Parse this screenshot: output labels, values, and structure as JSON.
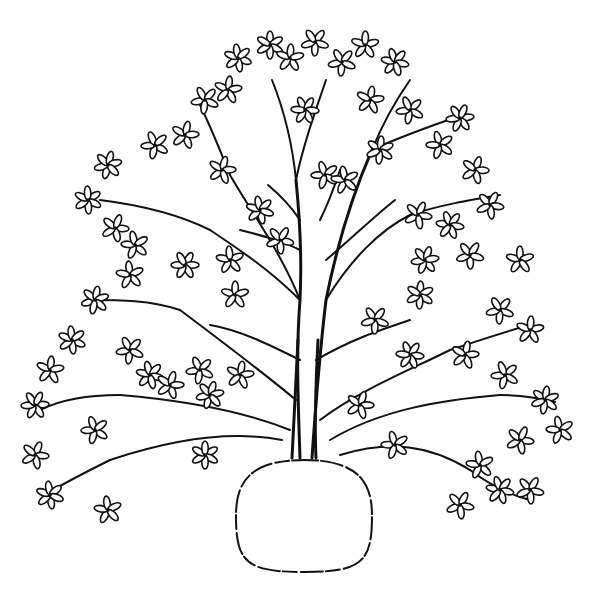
{
  "illustration": {
    "subject": "tree with root ball",
    "style": "black line art on white",
    "colors": {
      "ink": "#111111",
      "background": "#ffffff"
    },
    "root_ball": {
      "cx": 304,
      "cy": 516,
      "rx": 68,
      "ry": 56
    },
    "trunk_base": {
      "x": 304,
      "y": 455
    },
    "branches": [
      {
        "d": "M300 458 C298 400 296 350 300 300 C302 260 300 220 296 180"
      },
      {
        "d": "M312 458 C316 400 320 350 326 300 C336 250 350 200 372 150"
      },
      {
        "d": "M296 180 C292 140 284 110 272 80"
      },
      {
        "d": "M296 180 C304 140 316 110 326 80"
      },
      {
        "d": "M372 150 C384 120 396 100 410 80"
      },
      {
        "d": "M372 150 C392 140 420 130 448 120"
      },
      {
        "d": "M300 300 C270 270 240 250 210 230"
      },
      {
        "d": "M210 230 C180 215 140 205 100 200"
      },
      {
        "d": "M300 300 C280 250 250 210 230 175"
      },
      {
        "d": "M230 175 C220 150 210 125 200 105"
      },
      {
        "d": "M326 300 C350 260 380 230 410 215"
      },
      {
        "d": "M410 215 C440 205 470 200 500 195"
      },
      {
        "d": "M296 400 C260 370 220 340 180 310"
      },
      {
        "d": "M180 310 C150 300 120 300 90 300"
      },
      {
        "d": "M290 430 C240 410 180 400 120 395"
      },
      {
        "d": "M120 395 C90 395 60 400 40 410"
      },
      {
        "d": "M282 440 C230 430 170 440 110 460"
      },
      {
        "d": "M110 460 C80 475 60 485 45 495"
      },
      {
        "d": "M320 420 C360 390 410 370 450 350"
      },
      {
        "d": "M450 350 C480 340 510 330 530 325"
      },
      {
        "d": "M330 440 C380 410 440 400 500 395"
      },
      {
        "d": "M500 395 C520 395 540 398 555 402"
      },
      {
        "d": "M340 455 C390 440 430 445 470 470"
      },
      {
        "d": "M470 470 C490 485 510 495 530 500"
      },
      {
        "d": "M316 360 C350 340 380 330 410 320"
      },
      {
        "d": "M300 360 C270 345 240 330 210 325"
      },
      {
        "d": "M326 260 C350 240 370 220 395 200"
      },
      {
        "d": "M300 250 C280 240 260 235 240 230"
      },
      {
        "d": "M320 220 C330 200 335 185 340 170"
      },
      {
        "d": "M300 220 C290 205 280 195 268 185"
      }
    ],
    "flowers": [
      [
        270,
        45
      ],
      [
        315,
        42
      ],
      [
        365,
        45
      ],
      [
        238,
        58
      ],
      [
        290,
        58
      ],
      [
        342,
        62
      ],
      [
        395,
        62
      ],
      [
        205,
        100
      ],
      [
        228,
        90
      ],
      [
        305,
        110
      ],
      [
        370,
        100
      ],
      [
        410,
        110
      ],
      [
        460,
        118
      ],
      [
        155,
        145
      ],
      [
        185,
        135
      ],
      [
        108,
        165
      ],
      [
        222,
        170
      ],
      [
        325,
        175
      ],
      [
        380,
        150
      ],
      [
        440,
        145
      ],
      [
        475,
        170
      ],
      [
        88,
        200
      ],
      [
        115,
        228
      ],
      [
        135,
        245
      ],
      [
        260,
        210
      ],
      [
        345,
        180
      ],
      [
        418,
        215
      ],
      [
        450,
        225
      ],
      [
        490,
        205
      ],
      [
        130,
        275
      ],
      [
        185,
        265
      ],
      [
        230,
        260
      ],
      [
        280,
        240
      ],
      [
        425,
        260
      ],
      [
        470,
        255
      ],
      [
        520,
        260
      ],
      [
        95,
        300
      ],
      [
        235,
        295
      ],
      [
        375,
        320
      ],
      [
        420,
        295
      ],
      [
        500,
        310
      ],
      [
        530,
        330
      ],
      [
        72,
        340
      ],
      [
        50,
        370
      ],
      [
        130,
        350
      ],
      [
        150,
        375
      ],
      [
        200,
        370
      ],
      [
        240,
        375
      ],
      [
        410,
        355
      ],
      [
        465,
        355
      ],
      [
        505,
        375
      ],
      [
        35,
        405
      ],
      [
        95,
        430
      ],
      [
        170,
        385
      ],
      [
        210,
        395
      ],
      [
        360,
        405
      ],
      [
        395,
        445
      ],
      [
        545,
        400
      ],
      [
        560,
        430
      ],
      [
        35,
        455
      ],
      [
        205,
        455
      ],
      [
        520,
        440
      ],
      [
        480,
        465
      ],
      [
        50,
        495
      ],
      [
        108,
        510
      ],
      [
        460,
        505
      ],
      [
        500,
        490
      ],
      [
        530,
        490
      ]
    ]
  }
}
